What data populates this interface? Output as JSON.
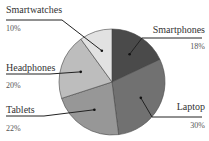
{
  "chart_data": {
    "type": "pie",
    "title": "",
    "start_angle": "12 o'clock",
    "direction": "clockwise",
    "categories": [
      "Smartphones",
      "Laptop",
      "Tablets",
      "Headphones",
      "Smartwatches"
    ],
    "values": [
      18,
      30,
      22,
      20,
      10
    ],
    "value_labels": [
      "18%",
      "30%",
      "22%",
      "20%",
      "10%"
    ],
    "colors": [
      "#4a4a4a",
      "#717171",
      "#979797",
      "#bdbdbd",
      "#e2e2e2"
    ],
    "legend": "none (external callout labels)"
  },
  "labels": {
    "smartphones": {
      "name": "Smartphones",
      "pct": "18%"
    },
    "laptop": {
      "name": "Laptop",
      "pct": "30%"
    },
    "tablets": {
      "name": "Tablets",
      "pct": "22%"
    },
    "headphones": {
      "name": "Headphones",
      "pct": "20%"
    },
    "smartwatches": {
      "name": "Smartwatches",
      "pct": "10%"
    }
  }
}
